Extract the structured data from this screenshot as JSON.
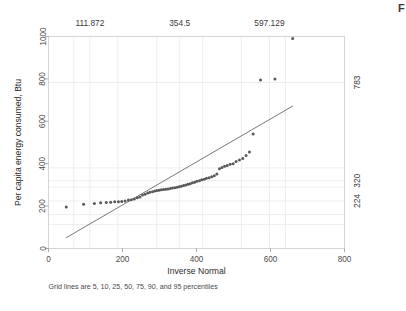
{
  "figure": {
    "corner_mark": "F",
    "background_color": "#ffffff",
    "point_color": "#5a5a5a",
    "line_color": "#555555",
    "grid_color": "#e6ebf0",
    "frame_color": "#c8cdd2"
  },
  "chart_data": {
    "type": "scatter",
    "title": "",
    "subtitle": "",
    "xlabel": "Inverse Normal",
    "ylabel": "Per capita energy consumed, Btu",
    "note": "Grid lines are 5, 10, 25, 50, 75, 90, and 95 percentiles",
    "xlim": [
      0,
      800
    ],
    "ylim": [
      0,
      1000
    ],
    "xticks": [
      0,
      200,
      400,
      600,
      800
    ],
    "xticklabels": [
      "0",
      "200",
      "400",
      "600",
      "800"
    ],
    "yticks": [
      0,
      200,
      400,
      600,
      800,
      1000
    ],
    "yticklabels": [
      "0",
      "200",
      "400",
      "600",
      "800",
      "1000"
    ],
    "grid": true,
    "legend": "none",
    "top_axis_labels": [
      {
        "value": 111.872,
        "label": "111.872"
      },
      {
        "value": 354.5,
        "label": "354.5"
      },
      {
        "value": 597.129,
        "label": "597.129"
      }
    ],
    "right_axis_labels": [
      {
        "value": 783,
        "label": "783"
      },
      {
        "value": 320,
        "label": "320"
      },
      {
        "value": 224,
        "label": "224"
      }
    ],
    "x_gridlines": [
      68.5,
      111.872,
      187.5,
      292.5,
      354.5,
      416.5,
      521.5,
      597.129,
      640.5
    ],
    "y_gridlines": [
      113,
      160,
      224,
      290,
      320,
      380,
      783
    ],
    "reference_line": {
      "label": "45-degree reference line",
      "x": [
        47,
        660
      ],
      "y": [
        50,
        672
      ]
    },
    "series": [
      {
        "name": "Per capita energy consumed, Btu",
        "marker": "circle",
        "color": "#5a5a5a",
        "points": [
          [
            48,
            196
          ],
          [
            95,
            209
          ],
          [
            124,
            212
          ],
          [
            141,
            216
          ],
          [
            156,
            217
          ],
          [
            168,
            218
          ],
          [
            179,
            220
          ],
          [
            189,
            221
          ],
          [
            198,
            222
          ],
          [
            207,
            224
          ],
          [
            216,
            229
          ],
          [
            224,
            230
          ],
          [
            232,
            234
          ],
          [
            240,
            239
          ],
          [
            247,
            243
          ],
          [
            254,
            252
          ],
          [
            261,
            256
          ],
          [
            268,
            262
          ],
          [
            274,
            265
          ],
          [
            281,
            268
          ],
          [
            287,
            271
          ],
          [
            293,
            273
          ],
          [
            299,
            275
          ],
          [
            305,
            277
          ],
          [
            311,
            278
          ],
          [
            317,
            280
          ],
          [
            323,
            281
          ],
          [
            329,
            283
          ],
          [
            335,
            285
          ],
          [
            341,
            287
          ],
          [
            347,
            289
          ],
          [
            353,
            291
          ],
          [
            359,
            294
          ],
          [
            365,
            297
          ],
          [
            371,
            300
          ],
          [
            377,
            303
          ],
          [
            383,
            306
          ],
          [
            389,
            310
          ],
          [
            395,
            313
          ],
          [
            401,
            317
          ],
          [
            408,
            320
          ],
          [
            414,
            324
          ],
          [
            421,
            327
          ],
          [
            427,
            331
          ],
          [
            434,
            334
          ],
          [
            441,
            338
          ],
          [
            448,
            343
          ],
          [
            455,
            352
          ],
          [
            462,
            376
          ],
          [
            469,
            382
          ],
          [
            476,
            388
          ],
          [
            483,
            392
          ],
          [
            491,
            397
          ],
          [
            499,
            400
          ],
          [
            507,
            410
          ],
          [
            516,
            418
          ],
          [
            525,
            424
          ],
          [
            534,
            439
          ],
          [
            543,
            455
          ],
          [
            553,
            540
          ],
          [
            573,
            795
          ],
          [
            612,
            800
          ],
          [
            660,
            990
          ]
        ]
      }
    ]
  }
}
